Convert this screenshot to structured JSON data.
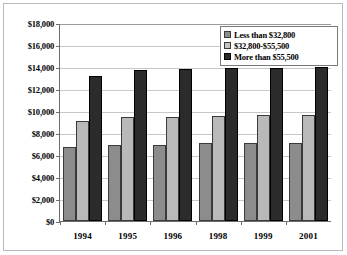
{
  "chart_data": {
    "type": "bar",
    "title": "",
    "xlabel": "",
    "ylabel": "",
    "ylim": [
      0,
      18000
    ],
    "ytick_step": 2000,
    "ytick_labels": [
      "$18,000",
      "$16,000",
      "$14,000",
      "$12,000",
      "$10,000",
      "$8,000",
      "$6,000",
      "$4,000",
      "$2,000",
      "$0"
    ],
    "ytick_values": [
      18000,
      16000,
      14000,
      12000,
      10000,
      8000,
      6000,
      4000,
      2000,
      0
    ],
    "grid": "horizontal",
    "legend_position": "top-right",
    "categories": [
      "1994",
      "1995",
      "1996",
      "1998",
      "1999",
      "2001"
    ],
    "series": [
      {
        "name": "Less than $32,800",
        "color": "#8c8c8c",
        "values": [
          6700,
          6950,
          6950,
          7050,
          7050,
          7100
        ]
      },
      {
        "name": "$32,800-$55,500",
        "color": "#b9b9b9",
        "values": [
          9100,
          9450,
          9450,
          9550,
          9600,
          9650
        ]
      },
      {
        "name": "More than $55,500",
        "color": "#2b2b2b",
        "values": [
          13200,
          13700,
          13800,
          13950,
          13950,
          14000
        ]
      }
    ]
  },
  "legend": {
    "items": [
      {
        "label": "Less than $32,800"
      },
      {
        "label": "$32,800-$55,500"
      },
      {
        "label": "More than $55,500"
      }
    ]
  }
}
